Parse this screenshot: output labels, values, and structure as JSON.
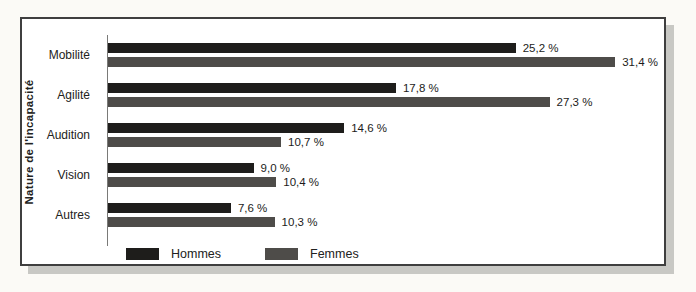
{
  "frame": {
    "page_background": "#fbfaf6",
    "panel_background": "#ffffff",
    "border_color": "#3f3f3f",
    "shadow_color": "#c8c8c4"
  },
  "chart_data": {
    "type": "bar",
    "orientation": "horizontal",
    "title": "",
    "ylabel": "Nature de l'incapacité",
    "xlabel": "",
    "categories": [
      "Mobilité",
      "Agilité",
      "Audition",
      "Vision",
      "Autres"
    ],
    "series": [
      {
        "name": "Hommes",
        "color": "#1e1d1b",
        "values": [
          25.2,
          17.8,
          14.6,
          9.0,
          7.6
        ],
        "labels": [
          "25,2 %",
          "17,8 %",
          "14,6 %",
          "9,0 %",
          "7,6 %"
        ]
      },
      {
        "name": "Femmes",
        "color": "#4e4c49",
        "values": [
          31.4,
          27.3,
          10.7,
          10.4,
          10.3
        ],
        "labels": [
          "31,4 %",
          "27,3 %",
          "10,7 %",
          "10,4 %",
          "10,3 %"
        ]
      }
    ],
    "xmax": 34,
    "grid": false,
    "legend_position": "bottom"
  }
}
